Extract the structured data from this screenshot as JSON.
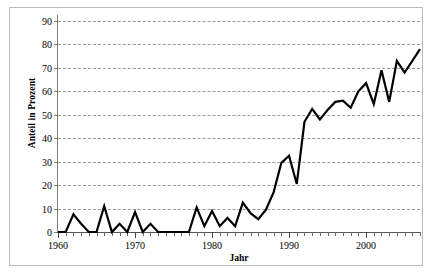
{
  "figure": {
    "background_color": "#ffffff",
    "frame_color": "#b9b9b9",
    "series_color": "#000000",
    "gridline_color": "#9a9a9a"
  },
  "chart_data": {
    "type": "line",
    "title": "",
    "xlabel": "Jahr",
    "ylabel": "Anteil in Prozent",
    "xlim": [
      1960,
      2007
    ],
    "ylim": [
      0,
      90
    ],
    "ytick_step": 10,
    "xtick_step": 10,
    "xtick_minor_step": 1,
    "grid": "horizontal-dashed",
    "legend": "none",
    "markers": "none",
    "line_width_px": 2.2,
    "yticks": [
      0,
      10,
      20,
      30,
      40,
      50,
      60,
      70,
      80,
      90
    ],
    "ytick_labels": [
      "0",
      "10",
      "20",
      "30",
      "40",
      "50",
      "60",
      "70",
      "80",
      "90"
    ],
    "xticks": [
      1960,
      1970,
      1980,
      1990,
      2000
    ],
    "xtick_labels": [
      "1960",
      "1970",
      "1980",
      "1990",
      "2000"
    ],
    "x": [
      1960,
      1961,
      1962,
      1963,
      1964,
      1965,
      1966,
      1967,
      1968,
      1969,
      1970,
      1971,
      1972,
      1973,
      1974,
      1975,
      1976,
      1977,
      1978,
      1979,
      1980,
      1981,
      1982,
      1983,
      1984,
      1985,
      1986,
      1987,
      1988,
      1989,
      1990,
      1991,
      1992,
      1993,
      1994,
      1995,
      1996,
      1997,
      1998,
      1999,
      2000,
      2001,
      2002,
      2003,
      2004,
      2005,
      2006,
      2007
    ],
    "values": [
      0,
      0,
      7.5,
      3.5,
      0,
      0,
      11,
      0,
      3.5,
      0,
      8.5,
      0,
      3.5,
      0,
      0,
      0,
      0,
      0,
      10.5,
      2.5,
      9,
      2.5,
      6,
      2.5,
      12.5,
      8,
      5.5,
      9.5,
      17,
      29.5,
      32.5,
      20.5,
      47,
      52.5,
      48,
      52,
      55.5,
      56,
      53,
      60,
      63.5,
      54.5,
      69,
      55.5,
      73,
      68,
      73,
      78
    ],
    "series_name": "Anteil in Prozent"
  }
}
